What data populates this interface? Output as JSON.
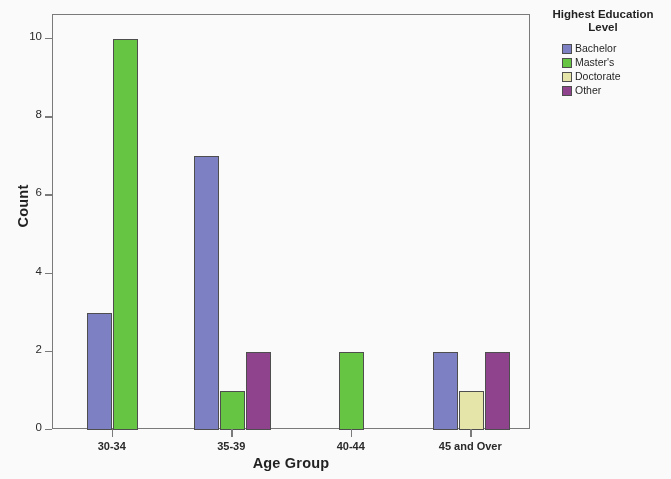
{
  "chart_data": {
    "type": "bar",
    "title": "",
    "xlabel": "Age Group",
    "ylabel": "Count",
    "categories": [
      "30-34",
      "35-39",
      "40-44",
      "45 and Over"
    ],
    "series": [
      {
        "name": "Bachelor",
        "color": "#7b80c6",
        "values": [
          3,
          7,
          0,
          2
        ]
      },
      {
        "name": "Master's",
        "color": "#63c83f",
        "values": [
          10,
          1,
          2,
          0
        ]
      },
      {
        "name": "Doctorate",
        "color": "#e9e9ab",
        "values": [
          0,
          0,
          0,
          1
        ]
      },
      {
        "name": "Other",
        "color": "#8f3e8c",
        "values": [
          0,
          2,
          0,
          2
        ]
      }
    ],
    "ylim": [
      0,
      10
    ],
    "yticks": [
      0,
      2,
      4,
      6,
      8,
      10
    ],
    "ytick_labels": [
      "0",
      "2",
      "4",
      "6",
      "8",
      "10"
    ],
    "grid": false,
    "legend_position": "right",
    "legend_title": "Highest Education Level"
  },
  "legend": {
    "title_line1": "Highest Education",
    "title_line2": "Level",
    "entries": [
      {
        "label": "Bachelor",
        "color": "#7b80c6"
      },
      {
        "label": "Master's",
        "color": "#63c83f"
      },
      {
        "label": "Doctorate",
        "color": "#e9e9ab"
      },
      {
        "label": "Other",
        "color": "#8f3e8c"
      }
    ]
  },
  "axes": {
    "y_title": "Count",
    "x_title": "Age Group"
  }
}
